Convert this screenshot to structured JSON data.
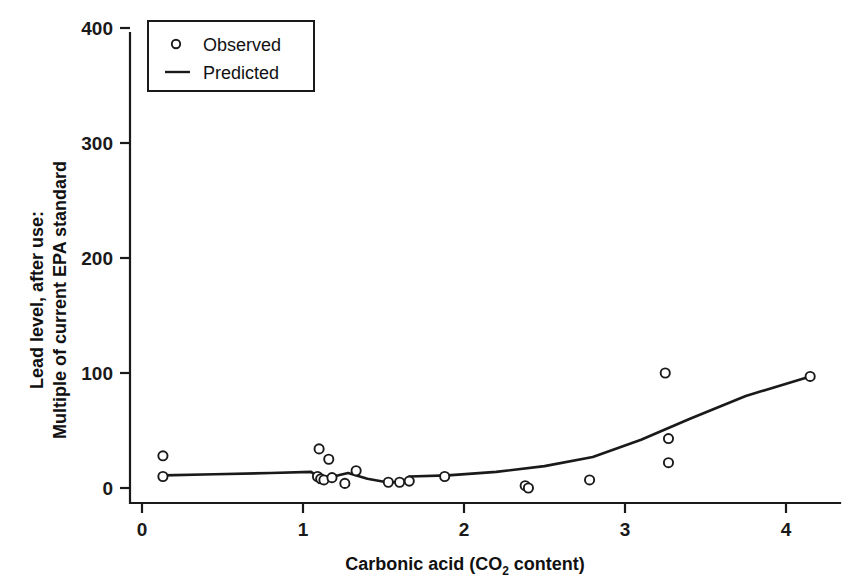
{
  "figure": {
    "background_color": "#ffffff",
    "ink_color": "#1a1a1a"
  },
  "axes": {
    "x_title_main": "Carbonic acid (CO",
    "x_title_sub": "2",
    "x_title_tail": " content)",
    "y_title_line1": "Lead level, after use:",
    "y_title_line2": "Multiple of current EPA standard",
    "x_ticks": [
      "0",
      "1",
      "2",
      "3",
      "4"
    ],
    "y_ticks": [
      "0",
      "100",
      "200",
      "300",
      "400"
    ]
  },
  "legend": {
    "observed_label": "Observed",
    "predicted_label": "Predicted",
    "observed_marker": "open-circle",
    "predicted_marker": "solid-line"
  },
  "chart_data": {
    "type": "scatter",
    "title": "",
    "xlabel": "Carbonic acid (CO2 content)",
    "ylabel": "Lead level, after use: Multiple of current EPA standard",
    "xlim": [
      0,
      4.4
    ],
    "ylim": [
      0,
      420
    ],
    "xticks": [
      0,
      1,
      2,
      3,
      4
    ],
    "yticks": [
      0,
      100,
      200,
      300,
      400
    ],
    "grid": false,
    "legend_position": "top-left",
    "series": [
      {
        "name": "Observed",
        "type": "scatter",
        "marker": "open-circle",
        "points": [
          {
            "x": 0.13,
            "y": 28
          },
          {
            "x": 0.13,
            "y": 10
          },
          {
            "x": 1.1,
            "y": 34
          },
          {
            "x": 1.09,
            "y": 10
          },
          {
            "x": 1.11,
            "y": 8
          },
          {
            "x": 1.13,
            "y": 7
          },
          {
            "x": 1.16,
            "y": 25
          },
          {
            "x": 1.18,
            "y": 9
          },
          {
            "x": 1.26,
            "y": 4
          },
          {
            "x": 1.33,
            "y": 15
          },
          {
            "x": 1.53,
            "y": 5
          },
          {
            "x": 1.6,
            "y": 5
          },
          {
            "x": 1.66,
            "y": 6
          },
          {
            "x": 1.88,
            "y": 10
          },
          {
            "x": 2.38,
            "y": 2
          },
          {
            "x": 2.4,
            "y": 0
          },
          {
            "x": 2.78,
            "y": 7
          },
          {
            "x": 3.25,
            "y": 100
          },
          {
            "x": 3.27,
            "y": 43
          },
          {
            "x": 3.27,
            "y": 22
          },
          {
            "x": 4.15,
            "y": 97
          }
        ]
      },
      {
        "name": "Predicted",
        "type": "line",
        "points": [
          {
            "x": 0.13,
            "y": 11
          },
          {
            "x": 0.45,
            "y": 12
          },
          {
            "x": 0.8,
            "y": 13
          },
          {
            "x": 1.05,
            "y": 14
          },
          {
            "x": 1.1,
            "y": 9
          },
          {
            "x": 1.22,
            "y": 11
          },
          {
            "x": 1.28,
            "y": 13
          },
          {
            "x": 1.4,
            "y": 8
          },
          {
            "x": 1.52,
            "y": 5
          },
          {
            "x": 1.62,
            "y": 5
          },
          {
            "x": 1.66,
            "y": 10
          },
          {
            "x": 1.9,
            "y": 11
          },
          {
            "x": 2.2,
            "y": 14
          },
          {
            "x": 2.5,
            "y": 19
          },
          {
            "x": 2.8,
            "y": 27
          },
          {
            "x": 3.1,
            "y": 42
          },
          {
            "x": 3.4,
            "y": 60
          },
          {
            "x": 3.75,
            "y": 80
          },
          {
            "x": 4.15,
            "y": 97
          }
        ]
      }
    ]
  }
}
